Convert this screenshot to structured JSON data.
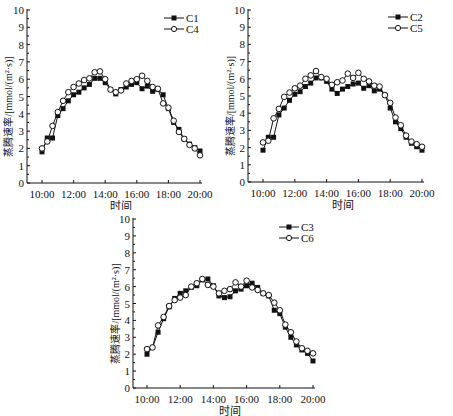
{
  "chart_data": [
    {
      "type": "line",
      "id": "chart-c1-c4",
      "xlabel": "时间",
      "ylabel": "蒸腾速率/[mmol/(m²·s)]",
      "ylim": [
        0,
        10
      ],
      "yticks": [
        0,
        1,
        2,
        3,
        4,
        5,
        6,
        7,
        8,
        9,
        10
      ],
      "xtick_labels": [
        "10:00",
        "12:00",
        "14:00",
        "16:00",
        "18:00",
        "20:00"
      ],
      "x_range_hours": [
        10,
        20
      ],
      "x_step_minutes": 20,
      "grid": false,
      "legend_position": "upper right",
      "series": [
        {
          "name": "C1",
          "marker": "filled-square",
          "values": [
            1.8,
            2.6,
            2.6,
            3.9,
            4.3,
            4.75,
            5.1,
            5.25,
            5.5,
            5.7,
            6.05,
            6.05,
            5.8,
            5.4,
            5.15,
            5.4,
            5.55,
            5.7,
            5.8,
            5.45,
            5.6,
            5.3,
            5.4,
            5.1,
            4.3,
            3.5,
            3.1,
            2.55,
            2.25,
            2.05,
            1.85
          ]
        },
        {
          "name": "C4",
          "marker": "open-circle",
          "values": [
            2.0,
            2.4,
            3.3,
            4.1,
            4.75,
            5.25,
            5.55,
            5.75,
            5.95,
            6.05,
            6.4,
            6.45,
            6.0,
            5.4,
            5.25,
            5.35,
            5.75,
            5.9,
            6.0,
            6.2,
            5.9,
            5.55,
            5.45,
            4.6,
            4.35,
            3.6,
            2.95,
            2.55,
            2.2,
            2.0,
            1.6
          ]
        }
      ]
    },
    {
      "type": "line",
      "id": "chart-c2-c5",
      "xlabel": "时间",
      "ylabel": "蒸腾速率/[mmol/(m²·s)]",
      "ylim": [
        0,
        10
      ],
      "yticks": [
        0,
        1,
        2,
        3,
        4,
        5,
        6,
        7,
        8,
        9,
        10
      ],
      "xtick_labels": [
        "10:00",
        "12:00",
        "14:00",
        "16:00",
        "18:00",
        "20:00"
      ],
      "x_range_hours": [
        10,
        20
      ],
      "x_step_minutes": 20,
      "grid": false,
      "legend_position": "upper right",
      "series": [
        {
          "name": "C2",
          "marker": "filled-square",
          "values": [
            1.85,
            2.6,
            2.6,
            3.9,
            4.3,
            4.75,
            5.1,
            5.25,
            5.55,
            5.75,
            6.05,
            6.05,
            5.85,
            5.4,
            5.15,
            5.4,
            5.55,
            5.7,
            5.75,
            5.45,
            5.6,
            5.3,
            5.4,
            5.05,
            4.3,
            3.5,
            3.1,
            2.6,
            2.25,
            2.05,
            1.85
          ]
        },
        {
          "name": "C5",
          "marker": "open-circle",
          "values": [
            2.3,
            2.4,
            3.7,
            4.25,
            4.95,
            5.2,
            5.45,
            5.6,
            6.0,
            6.2,
            6.45,
            6.1,
            6.0,
            5.65,
            5.8,
            5.9,
            6.3,
            6.05,
            6.35,
            6.0,
            5.85,
            5.6,
            5.55,
            5.05,
            4.6,
            3.75,
            3.3,
            2.7,
            2.35,
            2.2,
            2.05
          ]
        }
      ]
    },
    {
      "type": "line",
      "id": "chart-c3-c6",
      "xlabel": "时间",
      "ylabel": "蒸腾速率/[mmol/(m²·s)]",
      "ylim": [
        0,
        10
      ],
      "yticks": [
        0,
        1,
        2,
        3,
        4,
        5,
        6,
        7,
        8,
        9,
        10
      ],
      "xtick_labels": [
        "10:00",
        "12:00",
        "14:00",
        "16:00",
        "18:00",
        "20:00"
      ],
      "x_range_hours": [
        10,
        20
      ],
      "x_step_minutes": 20,
      "grid": false,
      "legend_position": "upper right",
      "series": [
        {
          "name": "C3",
          "marker": "filled-square",
          "values": [
            2.0,
            2.4,
            3.3,
            4.1,
            4.8,
            5.3,
            5.6,
            5.75,
            5.95,
            6.05,
            6.4,
            6.45,
            6.05,
            5.45,
            5.35,
            5.4,
            5.75,
            5.85,
            6.05,
            6.2,
            5.95,
            5.6,
            5.45,
            4.6,
            4.4,
            3.6,
            3.0,
            2.55,
            2.25,
            2.05,
            1.6
          ]
        },
        {
          "name": "C6",
          "marker": "open-circle",
          "values": [
            2.3,
            2.4,
            3.7,
            4.2,
            4.85,
            5.2,
            5.35,
            5.5,
            6.0,
            6.2,
            6.45,
            6.1,
            6.0,
            5.6,
            5.75,
            5.85,
            6.25,
            6.0,
            6.35,
            5.95,
            5.8,
            5.6,
            5.5,
            5.05,
            4.6,
            3.75,
            3.3,
            2.75,
            2.35,
            2.2,
            2.05
          ]
        }
      ]
    }
  ],
  "charts": [
    {
      "left": 0,
      "top": 0,
      "legend": [
        "C1",
        "C4"
      ],
      "xlabel": "时间",
      "ylabel": "蒸腾速率/[mmol/(m²·s)]"
    },
    {
      "left": 222,
      "top": 0,
      "legend": [
        "C2",
        "C5"
      ],
      "xlabel": "时间",
      "ylabel": "蒸腾速率/[mmol/(m²·s)]"
    },
    {
      "left": 107,
      "top": 208,
      "legend": [
        "C3",
        "C6"
      ],
      "xlabel": "时间",
      "ylabel": "蒸腾速率/[mmol/(m²·s)]"
    }
  ],
  "colors": {
    "line": "#111111",
    "background": "#ffffff"
  }
}
